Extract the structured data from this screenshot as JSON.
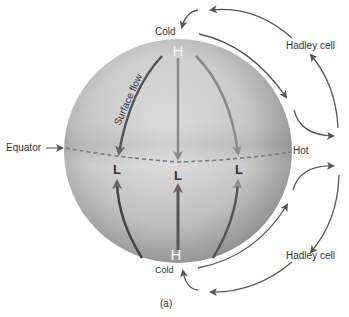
{
  "labels": {
    "cold_top": "Cold",
    "cold_bottom": "Cold",
    "hot": "Hot",
    "equator": "Equator",
    "hadley_top": "Hadley cell",
    "hadley_bottom": "Hadley cell",
    "surface_flow": "Surface flow",
    "caption": "(a)"
  },
  "pressure": {
    "high_top": "H",
    "high_bottom": "H",
    "low_left": "L",
    "low_center": "L",
    "low_right": "L"
  },
  "colors": {
    "arrow": "#555555",
    "sphere_light": "#e6e6e6",
    "sphere_dark": "#8a8a8a",
    "text": "#333333"
  }
}
